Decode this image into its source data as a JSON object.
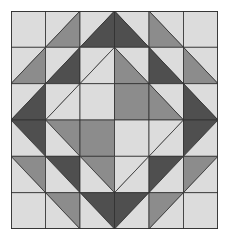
{
  "colors": {
    "light": "#dcdcdc",
    "medium": "#8c8c8c",
    "dark": "#4f4f4f",
    "outline": "#2e2e2e"
  },
  "grid": {
    "cols": 6,
    "rows": 6,
    "cells": [
      [
        [
          "L"
        ],
        [
          "/",
          "L",
          "M"
        ],
        [
          "/",
          "L",
          "D"
        ],
        [
          "\\",
          "L",
          "D"
        ],
        [
          "\\",
          "L",
          "M"
        ],
        [
          "L"
        ]
      ],
      [
        [
          "/",
          "L",
          "M"
        ],
        [
          "/",
          "L",
          "D"
        ],
        [
          "/",
          "L",
          "L"
        ],
        [
          "\\",
          "L",
          "M"
        ],
        [
          "\\",
          "L",
          "D"
        ],
        [
          "\\",
          "L",
          "M"
        ]
      ],
      [
        [
          "/",
          "L",
          "D"
        ],
        [
          "/",
          "L",
          "L"
        ],
        [
          "L"
        ],
        [
          "M"
        ],
        [
          "\\",
          "L",
          "M"
        ],
        [
          "\\",
          "L",
          "D"
        ]
      ],
      [
        [
          "\\",
          "D",
          "L"
        ],
        [
          "\\",
          "M",
          "L"
        ],
        [
          "M"
        ],
        [
          "L"
        ],
        [
          "/",
          "L",
          "L"
        ],
        [
          "/",
          "D",
          "L"
        ]
      ],
      [
        [
          "\\",
          "M",
          "L"
        ],
        [
          "\\",
          "D",
          "L"
        ],
        [
          "\\",
          "M",
          "L"
        ],
        [
          "/",
          "L",
          "L"
        ],
        [
          "/",
          "D",
          "L"
        ],
        [
          "/",
          "M",
          "L"
        ]
      ],
      [
        [
          "L"
        ],
        [
          "\\",
          "M",
          "L"
        ],
        [
          "\\",
          "D",
          "L"
        ],
        [
          "/",
          "D",
          "L"
        ],
        [
          "/",
          "M",
          "L"
        ],
        [
          "L"
        ]
      ]
    ]
  }
}
